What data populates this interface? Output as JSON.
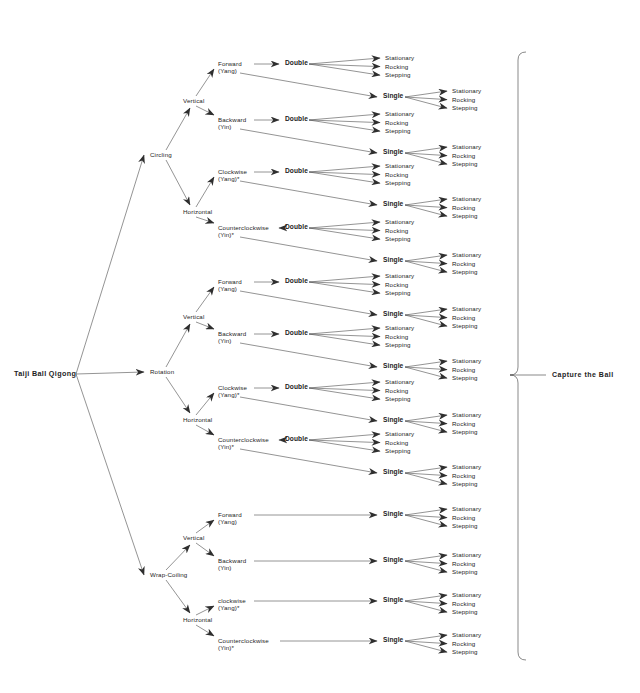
{
  "diagram": {
    "root_label": "Taiji Ball Qigong",
    "output_label": "Capture the Ball",
    "branches": [
      {
        "name": "Circling",
        "label": "Circling",
        "orientations": [
          {
            "label": "Vertical",
            "directions": [
              {
                "label": "Forward",
                "sub": "(Yang)",
                "modes": [
                  "Double",
                  "Single"
                ]
              },
              {
                "label": "Backward",
                "sub": "(Yin)",
                "modes": [
                  "Double",
                  "Single"
                ]
              }
            ]
          },
          {
            "label": "Horizontal",
            "directions": [
              {
                "label": "Clockwise",
                "sub": "(Yang)*",
                "modes": [
                  "Double",
                  "Single"
                ]
              },
              {
                "label": "Counterclockwise",
                "sub": "(Yin)*",
                "modes": [
                  "Double",
                  "Single"
                ]
              }
            ]
          }
        ]
      },
      {
        "name": "Rotation",
        "label": "Rotation",
        "orientations": [
          {
            "label": "Vertical",
            "directions": [
              {
                "label": "Forward",
                "sub": "(Yang)",
                "modes": [
                  "Double",
                  "Single"
                ]
              },
              {
                "label": "Backward",
                "sub": "(Yin)",
                "modes": [
                  "Double",
                  "Single"
                ]
              }
            ]
          },
          {
            "label": "Horizontal",
            "directions": [
              {
                "label": "Clockwise",
                "sub": "(Yang)*",
                "modes": [
                  "Double",
                  "Single"
                ]
              },
              {
                "label": "Counterclockwise",
                "sub": "(Yin)*",
                "modes": [
                  "Double",
                  "Single"
                ]
              }
            ]
          }
        ]
      },
      {
        "name": "Wrap-Coiling",
        "label": "Wrap-Coiling",
        "orientations": [
          {
            "label": "Vertical",
            "directions": [
              {
                "label": "Forward",
                "sub": "(Yang)",
                "modes": [
                  "Single"
                ]
              },
              {
                "label": "Backward",
                "sub": "(Yin)",
                "modes": [
                  "Single"
                ]
              }
            ]
          },
          {
            "label": "Horizontal",
            "directions": [
              {
                "label": "clockwise",
                "sub": "(Yang)*",
                "modes": [
                  "Single"
                ]
              },
              {
                "label": "Counterclockwise",
                "sub": "(Yin)*",
                "modes": [
                  "Single"
                ]
              }
            ]
          }
        ]
      }
    ],
    "mode_labels": {
      "double": "Double",
      "single": "Single"
    },
    "stance_labels": [
      "Stationary",
      "Rocking",
      "Stepping"
    ],
    "colors": {
      "ink": "#1d1d1d",
      "line": "#3a3a3a",
      "background": "#ffffff"
    }
  }
}
